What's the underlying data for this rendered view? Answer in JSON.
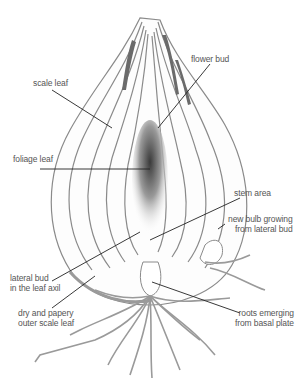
{
  "diagram": {
    "colors": {
      "outline": "#8a8a8a",
      "leader_line": "#222222",
      "label_text": "#555555",
      "shading_dark": "#3a3a3a",
      "background": "#ffffff"
    },
    "labels": [
      {
        "id": "scale-leaf",
        "text": "scale leaf"
      },
      {
        "id": "flower-bud",
        "text": "flower bud"
      },
      {
        "id": "foliage-leaf",
        "text": "foliage leaf"
      },
      {
        "id": "stem-area",
        "text": "stem area"
      },
      {
        "id": "new-bulb",
        "text": "new bulb growing\nfrom lateral bud"
      },
      {
        "id": "lateral-bud",
        "text": "lateral bud\nin the leaf axil"
      },
      {
        "id": "dry-outer-leaf",
        "text": "dry and papery\nouter scale leaf"
      },
      {
        "id": "roots",
        "text": "roots emerging\nfrom basal plate"
      }
    ]
  }
}
